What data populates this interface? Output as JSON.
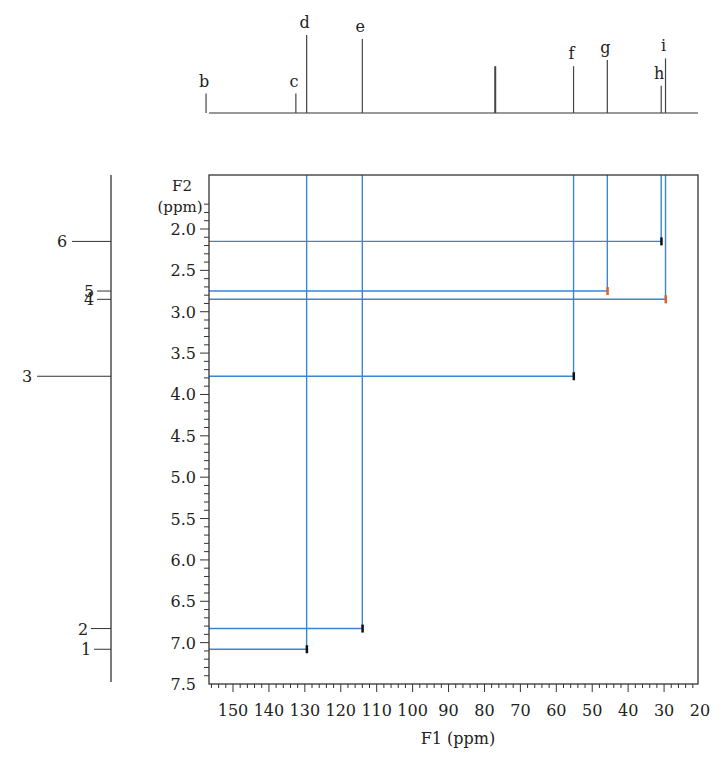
{
  "chart_data": {
    "type": "hsqc-2d-nmr",
    "title": "",
    "xlabel": "F1 (ppm)",
    "ylabel": "F2 (ppm)",
    "ylabel_lines": [
      "F2",
      "(ppm)"
    ],
    "xlim": [
      158,
      20
    ],
    "ylim": [
      1.7,
      7.5
    ],
    "x_ticks": [
      150,
      140,
      130,
      120,
      110,
      100,
      90,
      80,
      70,
      60,
      50,
      40,
      30,
      20
    ],
    "y_ticks": [
      "2.0",
      "2.5",
      "3.0",
      "3.5",
      "4.0",
      "4.5",
      "5.0",
      "5.5",
      "6.0",
      "6.5",
      "7.0",
      "7.5"
    ],
    "grid": false,
    "carbon_spectrum": {
      "axis": "top",
      "peaks": [
        {
          "label": "b",
          "ppm": 157.5,
          "height": 0.25
        },
        {
          "label": "c",
          "ppm": 132.5,
          "height": 0.25
        },
        {
          "label": "d",
          "ppm": 129.5,
          "height": 1.0
        },
        {
          "label": "e",
          "ppm": 114.0,
          "height": 0.95
        },
        {
          "label": "",
          "ppm": 77.0,
          "height": 0.6
        },
        {
          "label": "f",
          "ppm": 55.2,
          "height": 0.6
        },
        {
          "label": "g",
          "ppm": 45.8,
          "height": 0.68
        },
        {
          "label": "h",
          "ppm": 30.8,
          "height": 0.35
        },
        {
          "label": "i",
          "ppm": 29.6,
          "height": 0.7
        }
      ]
    },
    "proton_spectrum": {
      "axis": "left",
      "peaks": [
        {
          "label": "6",
          "ppm": 2.15
        },
        {
          "label": "5",
          "ppm": 2.75
        },
        {
          "label": "4",
          "ppm": 2.85
        },
        {
          "label": "3",
          "ppm": 3.78
        },
        {
          "label": "2",
          "ppm": 6.83
        },
        {
          "label": "1",
          "ppm": 7.08
        }
      ]
    },
    "cross_peaks": [
      {
        "f1": 30.8,
        "f2": 2.15,
        "color": "#111111"
      },
      {
        "f1": 45.8,
        "f2": 2.75,
        "color": "#e0602a"
      },
      {
        "f1": 29.6,
        "f2": 2.85,
        "color": "#e0602a"
      },
      {
        "f1": 55.2,
        "f2": 3.78,
        "color": "#111111"
      },
      {
        "f1": 114.0,
        "f2": 6.83,
        "color": "#111111"
      },
      {
        "f1": 129.5,
        "f2": 7.08,
        "color": "#111111"
      }
    ],
    "colors": {
      "correlation_line": "#3a86d0",
      "axis": "#333333",
      "negative_peak": "#e0602a",
      "positive_peak": "#111111"
    }
  }
}
